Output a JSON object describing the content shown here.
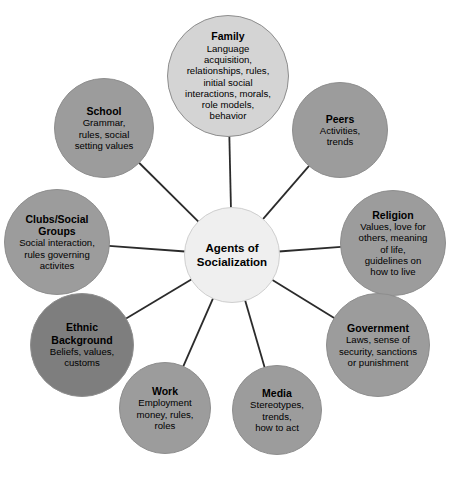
{
  "diagram": {
    "title": "Agents of Socialization",
    "type": "hub-and-spoke concept map",
    "canvas": {
      "width": 449,
      "height": 479,
      "background": "#ffffff"
    },
    "colors": {
      "center_fill": "#efefef",
      "center_stroke": "#cfcfcf",
      "light_fill": "#d4d4d4",
      "medium_fill": "#9c9c9c",
      "dark_fill": "#7e7e7e",
      "node_stroke": "#8e8e8e",
      "edge_stroke": "#2b2b2b",
      "text": "#000000"
    },
    "center": {
      "id": "center",
      "title": "Agents of\nSocialization",
      "cx": 232,
      "cy": 255,
      "r": 48,
      "fill": "#efefef",
      "title_size": 11.5
    },
    "nodes": [
      {
        "id": "family",
        "title": "Family",
        "desc": "Language\nacquisition,\nrelationships, rules,\ninitial social\ninteractions, morals,\nrole models,\nbehavior",
        "cx": 228,
        "cy": 76,
        "r": 61,
        "fill": "#d4d4d4",
        "title_size": 10.5,
        "desc_size": 9.6
      },
      {
        "id": "peers",
        "title": "Peers",
        "desc": "Activities,\ntrends",
        "cx": 340,
        "cy": 130,
        "r": 48,
        "fill": "#9c9c9c",
        "title_size": 10.5,
        "desc_size": 9.6
      },
      {
        "id": "religion",
        "title": "Religion",
        "desc": "Values, love for\nothers, meaning\nof life,\nguidelines on\nhow to live",
        "cx": 393,
        "cy": 243,
        "r": 53,
        "fill": "#9c9c9c",
        "title_size": 10.5,
        "desc_size": 9.6
      },
      {
        "id": "government",
        "title": "Government",
        "desc": "Laws, sense of\nsecurity, sanctions\nor punishment",
        "cx": 378,
        "cy": 345,
        "r": 52,
        "fill": "#9c9c9c",
        "title_size": 10.5,
        "desc_size": 9.6
      },
      {
        "id": "media",
        "title": "Media",
        "desc": "Stereotypes,\ntrends,\nhow to act",
        "cx": 277,
        "cy": 410,
        "r": 45,
        "fill": "#9c9c9c",
        "title_size": 10.5,
        "desc_size": 9.6
      },
      {
        "id": "work",
        "title": "Work",
        "desc": "Employment\nmoney, rules,\nroles",
        "cx": 165,
        "cy": 408,
        "r": 46,
        "fill": "#9c9c9c",
        "title_size": 10.5,
        "desc_size": 9.6
      },
      {
        "id": "ethnic-background",
        "title": "Ethnic\nBackground",
        "desc": "Beliefs, values,\ncustoms",
        "cx": 82,
        "cy": 345,
        "r": 52,
        "fill": "#7e7e7e",
        "title_size": 10.5,
        "desc_size": 9.6
      },
      {
        "id": "clubs-social-groups",
        "title": "Clubs/Social\nGroups",
        "desc": "Social interaction,\nrules governing\nactivites",
        "cx": 57,
        "cy": 242,
        "r": 53,
        "fill": "#9c9c9c",
        "title_size": 10.5,
        "desc_size": 9.6
      },
      {
        "id": "school",
        "title": "School",
        "desc": "Grammar,\nrules, social\nsetting values",
        "cx": 104,
        "cy": 128,
        "r": 50,
        "fill": "#9c9c9c",
        "title_size": 10.5,
        "desc_size": 9.6
      }
    ],
    "edges": [
      {
        "id": "edge-center-family",
        "from": "center",
        "to": "family"
      },
      {
        "id": "edge-center-peers",
        "from": "center",
        "to": "peers"
      },
      {
        "id": "edge-center-religion",
        "from": "center",
        "to": "religion"
      },
      {
        "id": "edge-center-government",
        "from": "center",
        "to": "government"
      },
      {
        "id": "edge-center-media",
        "from": "center",
        "to": "media"
      },
      {
        "id": "edge-center-work",
        "from": "center",
        "to": "work"
      },
      {
        "id": "edge-center-ethnic-background",
        "from": "center",
        "to": "ethnic-background"
      },
      {
        "id": "edge-center-clubs-social-groups",
        "from": "center",
        "to": "clubs-social-groups"
      },
      {
        "id": "edge-center-school",
        "from": "center",
        "to": "school"
      }
    ]
  }
}
